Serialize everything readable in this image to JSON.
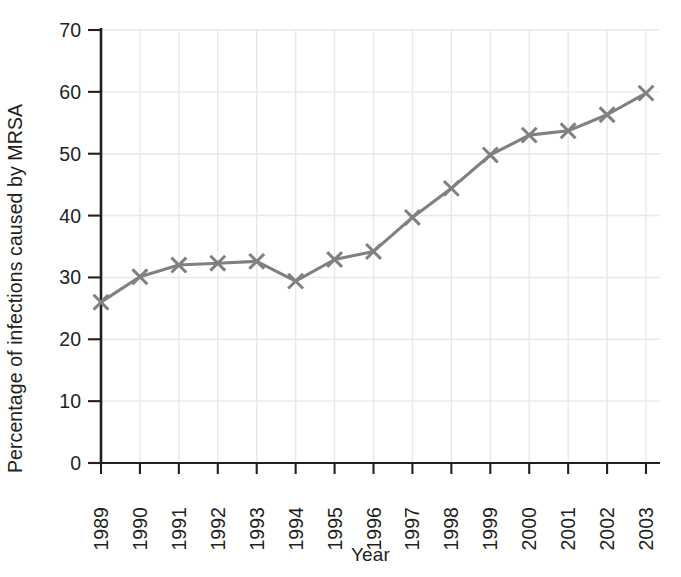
{
  "chart_data": {
    "type": "line",
    "title": "",
    "xlabel": "Year",
    "ylabel": "Percentage of infections caused by MRSA",
    "categories": [
      "1989",
      "1990",
      "1991",
      "1992",
      "1993",
      "1994",
      "1995",
      "1996",
      "1997",
      "1998",
      "1999",
      "2000",
      "2001",
      "2002",
      "2003"
    ],
    "values": [
      26.0,
      30.1,
      32.0,
      32.3,
      32.6,
      29.4,
      32.9,
      34.2,
      39.7,
      44.4,
      49.8,
      53.0,
      53.7,
      56.3,
      59.8
    ],
    "series": [
      {
        "name": "Percentage of infections caused by MRSA",
        "values": [
          26.0,
          30.1,
          32.0,
          32.3,
          32.6,
          29.4,
          32.9,
          34.2,
          39.7,
          44.4,
          49.8,
          53.0,
          53.7,
          56.3,
          59.8
        ]
      }
    ],
    "ylim": [
      0,
      70
    ],
    "yticks": [
      0,
      10,
      20,
      30,
      40,
      50,
      60,
      70
    ],
    "ytick_labels": [
      "0",
      "10",
      "20",
      "30",
      "40",
      "50",
      "60",
      "70"
    ],
    "grid": true,
    "grid_axes": "both",
    "legend": false,
    "legend_position": "none",
    "marker": "x",
    "line_color": "#808080",
    "marker_color": "#808080",
    "grid_color": "#e8e8e8",
    "axis_color": "#231f20",
    "text_color": "#231f20",
    "xtick_rotation": -90
  }
}
